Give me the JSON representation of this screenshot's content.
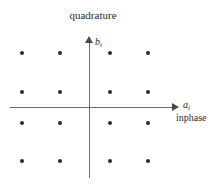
{
  "figure": {
    "title": "quadrature",
    "y_axis_label": "b",
    "y_axis_sub": "i",
    "x_axis_label": "a",
    "x_axis_sub": "i",
    "x_axis_sublabel": "inphase",
    "point_color": "#2a2a2a",
    "axis_color": "#6b6b6b"
  },
  "chart_data": {
    "type": "scatter",
    "title": "quadrature",
    "xlabel": "a_i  (inphase)",
    "ylabel": "b_i  (quadrature)",
    "xlim": [
      -3,
      3
    ],
    "ylim": [
      -3,
      3
    ],
    "grid": false,
    "legend": "none",
    "series": [
      {
        "name": "16-QAM constellation",
        "x": [
          -3,
          -1,
          1,
          3,
          -3,
          -1,
          1,
          3,
          -3,
          -1,
          1,
          3,
          -3,
          -1,
          1,
          3
        ],
        "y": [
          3,
          3,
          3,
          3,
          1,
          1,
          1,
          1,
          -1,
          -1,
          -1,
          -1,
          -3,
          -3,
          -3,
          -3
        ]
      }
    ],
    "points_px": [
      {
        "x": 22,
        "y": 53
      },
      {
        "x": 60,
        "y": 53
      },
      {
        "x": 110,
        "y": 53
      },
      {
        "x": 148,
        "y": 53
      },
      {
        "x": 22,
        "y": 92
      },
      {
        "x": 60,
        "y": 92
      },
      {
        "x": 110,
        "y": 92
      },
      {
        "x": 148,
        "y": 92
      },
      {
        "x": 22,
        "y": 123
      },
      {
        "x": 60,
        "y": 123
      },
      {
        "x": 110,
        "y": 123
      },
      {
        "x": 148,
        "y": 123
      },
      {
        "x": 22,
        "y": 161
      },
      {
        "x": 60,
        "y": 161
      },
      {
        "x": 110,
        "y": 161
      },
      {
        "x": 148,
        "y": 161
      }
    ]
  }
}
